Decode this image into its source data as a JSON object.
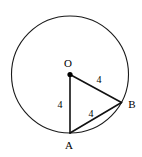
{
  "figure": {
    "background_color": "#ffffff",
    "stroke_color": "#111111",
    "circle_stroke_color": "#1a1a1a",
    "width": 142,
    "height": 157,
    "circle": {
      "center_x": 70,
      "center_y": 74.5,
      "radius": 58.5
    },
    "points": [
      {
        "id": "O",
        "label": "O",
        "x": 70,
        "y": 74.5,
        "label_x": 68,
        "label_y": 67,
        "has_dot": true
      },
      {
        "id": "A",
        "label": "A",
        "x": 70,
        "y": 133,
        "label_x": 69,
        "label_y": 149,
        "has_dot": false
      },
      {
        "id": "B",
        "label": "B",
        "x": 121.5,
        "y": 102.5,
        "label_x": 132,
        "label_y": 108,
        "has_dot": false
      }
    ],
    "segments": [
      {
        "id": "OA",
        "from": "O",
        "to": "A",
        "length_label": "4",
        "label_x": 60,
        "label_y": 108
      },
      {
        "id": "OB",
        "from": "O",
        "to": "B",
        "length_label": "4",
        "label_x": 99,
        "label_y": 83
      },
      {
        "id": "AB",
        "from": "A",
        "to": "B",
        "length_label": "4",
        "label_x": 91,
        "label_y": 117
      }
    ]
  }
}
